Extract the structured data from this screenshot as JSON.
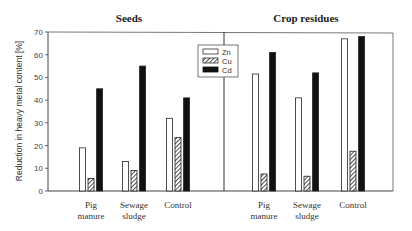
{
  "chart_data": {
    "type": "bar",
    "ylabel": "Reduction in heavy metal content [%]",
    "ylim": [
      0,
      70
    ],
    "yticks": [
      0,
      10,
      20,
      30,
      40,
      50,
      60,
      70
    ],
    "grid": false,
    "legend": {
      "placement": "top-center",
      "entries": [
        "Zn",
        "Cu",
        "Cd"
      ]
    },
    "series_styles": {
      "Zn": "open",
      "Cu": "hatched",
      "Cd": "solid"
    },
    "panels": [
      {
        "title": "Seeds",
        "categories": [
          "Pig manure",
          "Sewage sludge",
          "Control"
        ],
        "category_lines": [
          [
            "Pig",
            "manure"
          ],
          [
            "Sewage",
            "sludge"
          ],
          [
            "Control"
          ]
        ],
        "series": [
          {
            "name": "Zn",
            "values": [
              19,
              13,
              32
            ]
          },
          {
            "name": "Cu",
            "values": [
              5.5,
              9,
              23.5
            ]
          },
          {
            "name": "Cd",
            "values": [
              45,
              55,
              41
            ]
          }
        ]
      },
      {
        "title": "Crop residues",
        "categories": [
          "Pig manure",
          "Sewage sludge",
          "Control"
        ],
        "category_lines": [
          [
            "Pig",
            "manure"
          ],
          [
            "Sewage",
            "sludge"
          ],
          [
            "Control"
          ]
        ],
        "series": [
          {
            "name": "Zn",
            "values": [
              51.5,
              41,
              67
            ]
          },
          {
            "name": "Cu",
            "values": [
              7.5,
              6.5,
              17.5
            ]
          },
          {
            "name": "Cd",
            "values": [
              61,
              52,
              68
            ]
          }
        ]
      }
    ]
  }
}
